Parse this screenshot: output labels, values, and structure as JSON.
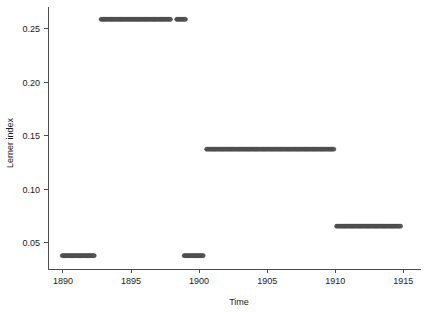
{
  "chart_data": {
    "type": "scatter",
    "title": "",
    "subtitle": "",
    "xlabel": "Time",
    "ylabel": "Lerner index",
    "xlim": [
      1888.9,
      1916.3
    ],
    "ylim": [
      0.0255,
      0.2705
    ],
    "xticks": [
      1890,
      1895,
      1900,
      1905,
      1910,
      1915
    ],
    "xticklabels": [
      "1890",
      "1895",
      "1900",
      "1905",
      "1910",
      "1915"
    ],
    "yticks": [
      0.05,
      0.1,
      0.15,
      0.2,
      0.25
    ],
    "yticklabels": [
      "0.05",
      "0.10",
      "0.15",
      "0.20",
      "0.25"
    ],
    "grid": false,
    "legend": null,
    "marker_color": "#575757",
    "marker_edge_color": "#3d3d3d",
    "marker_shape": "circle",
    "marker_size": 3.1,
    "axis_color": "#4d4d4d",
    "background_color": "#ffffff",
    "segments": [
      {
        "name": "regime-1-low-1890",
        "y": 0.038,
        "x_start": 1889.95,
        "x_end": 1892.3,
        "n_points": 29
      },
      {
        "name": "regime-2-high-1893",
        "y": 0.259,
        "x_start": 1892.8,
        "x_end": 1897.9,
        "n_points": 62
      },
      {
        "name": "regime-2b-high-1898",
        "y": 0.259,
        "x_start": 1898.35,
        "x_end": 1899.0,
        "n_points": 9
      },
      {
        "name": "regime-3-low-1899",
        "y": 0.038,
        "x_start": 1898.9,
        "x_end": 1900.3,
        "n_points": 18
      },
      {
        "name": "regime-4-mid-1901",
        "y": 0.1375,
        "x_start": 1900.55,
        "x_end": 1909.9,
        "n_points": 113
      },
      {
        "name": "regime-5-lowmid-1910",
        "y": 0.0655,
        "x_start": 1910.1,
        "x_end": 1914.8,
        "n_points": 57
      }
    ]
  }
}
